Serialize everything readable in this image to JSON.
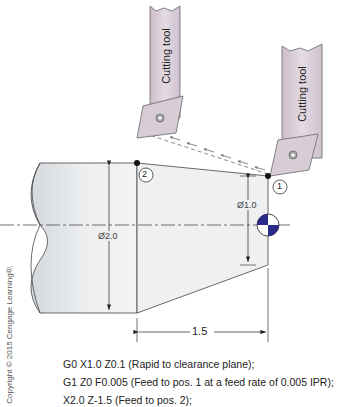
{
  "diagram": {
    "tool_label": "Cutting tool",
    "dims": {
      "large_diameter": "Ø2.0",
      "small_diameter": "Ø1.0",
      "length": "1.5"
    },
    "positions": {
      "p1": "1",
      "p2": "2"
    },
    "colors": {
      "part_fill": "#e8eaec",
      "tool_fill": "#d9cdd8",
      "datum_fill": "#2a2a8a"
    }
  },
  "gcode": {
    "lines": [
      "G0 X1.0 Z0.1 (Rapid to clearance plane);",
      "G1 Z0 F0.005 (Feed to pos. 1 at a feed rate of 0.005 IPR);",
      "X2.0 Z-1.5 (Feed to pos. 2);"
    ]
  },
  "copyright": "Copyright © 2015 Cengage Learning®."
}
